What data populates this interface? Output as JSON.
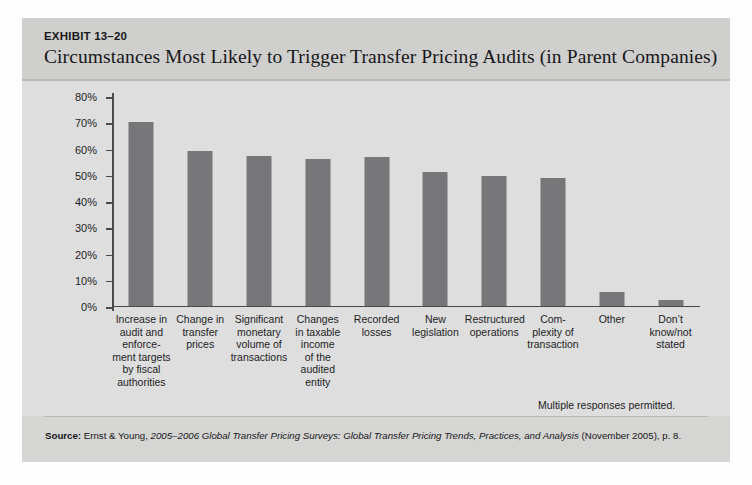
{
  "exhibit": {
    "number": "EXHIBIT 13–20",
    "title": "Circumstances Most Likely to Trigger Transfer Pricing Audits (in Parent Companies)"
  },
  "note": "Multiple responses permitted.",
  "source": {
    "label": "Source:",
    "publisher": " Ernst & Young, ",
    "work": "2005–2006 Global Transfer Pricing Surveys: Global Transfer Pricing Trends, Practices, and Analysis",
    "trailing": " (November 2005), p. 8."
  },
  "colors": {
    "bar": "#77777a",
    "panel": "#d5d5d3",
    "plot_background": "#dedede",
    "axis": "#4a4a4a",
    "text": "#1d1d1f"
  },
  "chart_data": {
    "type": "bar",
    "title": "Circumstances Most Likely to Trigger Transfer Pricing Audits (in Parent Companies)",
    "xlabel": "",
    "ylabel": "",
    "ylim": [
      0,
      80
    ],
    "grid": false,
    "legend": false,
    "ytick_labels": [
      "0%",
      "10%",
      "20%",
      "30%",
      "40%",
      "50%",
      "60%",
      "70%",
      "80%"
    ],
    "ytick_values": [
      0,
      10,
      20,
      30,
      40,
      50,
      60,
      70,
      80
    ],
    "categories": [
      "Increase in audit and enforce-\nment targets by fiscal authorities",
      "Change in transfer prices",
      "Significant monetary volume of transactions",
      "Changes in taxable income of the audited entity",
      "Recorded losses",
      "New legislation",
      "Restructured operations",
      "Com-\nplexity of transaction",
      "Other",
      "Don’t know/not stated"
    ],
    "category_lines": [
      [
        "Increase in",
        "audit and",
        "enforce-",
        "ment targets",
        "by fiscal",
        "authorities"
      ],
      [
        "Change in",
        "transfer",
        "prices"
      ],
      [
        "Significant",
        "monetary",
        "volume of",
        "transactions"
      ],
      [
        "Changes",
        "in taxable",
        "income",
        "of the",
        "audited",
        "entity"
      ],
      [
        "Recorded",
        "losses"
      ],
      [
        "New",
        "legislation"
      ],
      [
        "Restructured",
        "operations"
      ],
      [
        "Com-",
        "plexity of",
        "transaction"
      ],
      [
        "Other"
      ],
      [
        "Don’t",
        "know/not",
        "stated"
      ]
    ],
    "values": [
      70,
      59,
      57,
      56,
      56.5,
      51,
      49.5,
      48.5,
      5,
      2
    ],
    "units": "percent"
  }
}
